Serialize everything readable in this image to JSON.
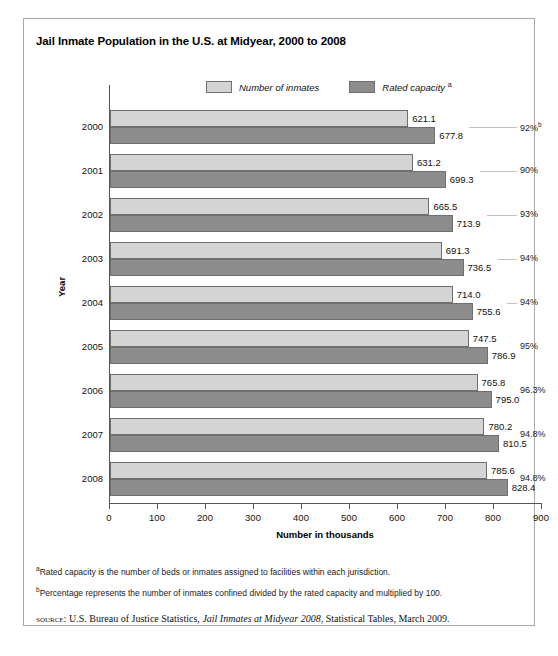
{
  "figure": {
    "title": "Jail Inmate Population in the U.S. at Midyear, 2000 to 2008",
    "footnote_a_marker": "a",
    "footnote_a": "Rated capacity is the number of beds or inmates assigned to facilities within each jurisdiction.",
    "footnote_b_marker": "b",
    "footnote_b": "Percentage represents the number of inmates confined divided by the rated capacity and multiplied by 100.",
    "source_label": "source:",
    "source_pre": " U.S. Bureau of Justice Statistics, ",
    "source_title": "Jail Inmates at Midyear 2008",
    "source_post": ", Statistical Tables, March 2009."
  },
  "legend": {
    "items": [
      {
        "label": "Number of inmates",
        "marker": "",
        "color": "#d4d4d4"
      },
      {
        "label": "Rated capacity ",
        "marker": "a",
        "color": "#8c8c8c"
      }
    ]
  },
  "chart_data": {
    "type": "bar",
    "orientation": "horizontal",
    "title": "Jail Inmate Population in the U.S. at Midyear, 2000 to 2008",
    "xlabel": "Number in thousands",
    "ylabel": "Year",
    "xlim": [
      0,
      900
    ],
    "xticks": [
      0,
      100,
      200,
      300,
      400,
      500,
      600,
      700,
      800,
      900
    ],
    "grid": false,
    "legend_position": "top",
    "categories": [
      "2000",
      "2001",
      "2002",
      "2003",
      "2004",
      "2005",
      "2006",
      "2007",
      "2008"
    ],
    "series": [
      {
        "name": "Number of inmates",
        "color": "#d4d4d4",
        "values": [
          621.1,
          631.2,
          665.5,
          691.3,
          714.0,
          747.5,
          765.8,
          780.2,
          785.6
        ],
        "labels": [
          "621.1",
          "631.2",
          "665.5",
          "691.3",
          "714.0",
          "747.5",
          "765.8",
          "780.2",
          "785.6"
        ]
      },
      {
        "name": "Rated capacity",
        "color": "#8c8c8c",
        "values": [
          677.8,
          699.3,
          713.9,
          736.5,
          755.6,
          786.9,
          795.0,
          810.5,
          828.4
        ],
        "labels": [
          "677.8",
          "699.3",
          "713.9",
          "736.5",
          "755.6",
          "786.9",
          "795.0",
          "810.5",
          "828.4"
        ]
      }
    ],
    "annotations": {
      "name": "percent of capacity occupied",
      "values": [
        "92%",
        "90%",
        "93%",
        "94%",
        "94%",
        "95%",
        "96.3%",
        "94.8%",
        "94.8%"
      ],
      "markers": [
        "b",
        "",
        "",
        "",
        "",
        "",
        "",
        "",
        ""
      ]
    }
  }
}
